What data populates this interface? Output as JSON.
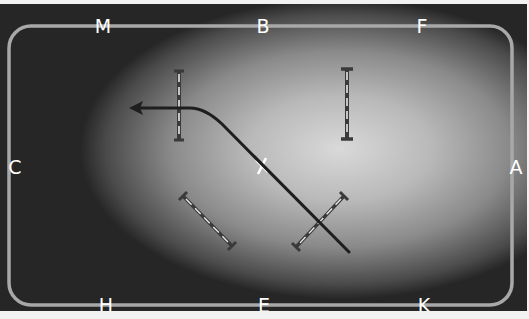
{
  "diagram": {
    "colors": {
      "arena_border": "#a8a8a8",
      "letters": "#ffffff",
      "track_line": "#1e1e1e",
      "jump_pole": "#dcdcdc",
      "jump_stand": "#3a3a3a"
    },
    "markers": {
      "top": [
        {
          "label": "M",
          "x": 103,
          "y": 28
        },
        {
          "label": "B",
          "x": 263,
          "y": 28
        },
        {
          "label": "F",
          "x": 422,
          "y": 28
        }
      ],
      "bottom": [
        {
          "label": "H",
          "x": 106,
          "y": 306
        },
        {
          "label": "E",
          "x": 264,
          "y": 306
        },
        {
          "label": "K",
          "x": 424,
          "y": 306
        }
      ],
      "left": [
        {
          "label": "C",
          "x": 14,
          "y": 166
        }
      ],
      "right": [
        {
          "label": "A",
          "x": 515,
          "y": 166
        }
      ],
      "center": [
        {
          "label": "X",
          "x": 262,
          "y": 160
        }
      ]
    },
    "jumps": [
      {
        "name": "jump-1",
        "x1": 179,
        "y1": 63,
        "x2": 179,
        "y2": 132
      },
      {
        "name": "jump-2",
        "x1": 347,
        "y1": 61,
        "x2": 347,
        "y2": 131
      },
      {
        "name": "jump-3",
        "x1": 183,
        "y1": 188,
        "x2": 232,
        "y2": 238
      },
      {
        "name": "jump-4",
        "x1": 344,
        "y1": 188,
        "x2": 296,
        "y2": 239
      }
    ],
    "track": {
      "description": "Diagonal line from near K across X, curving left to an arrow pointing toward C",
      "arrow_direction": "left"
    }
  }
}
